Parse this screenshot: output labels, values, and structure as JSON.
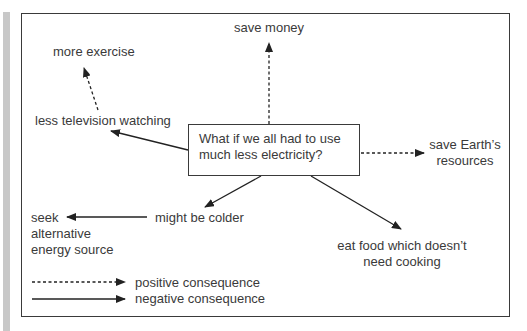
{
  "diagram": {
    "central_question": [
      "What if we all had to use",
      "much less electricity?"
    ],
    "nodes": {
      "save_money": "save money",
      "more_exercise": "more exercise",
      "less_tv": "less television watching",
      "save_resources": [
        "save Earth’s",
        "resources"
      ],
      "might_be_colder": "might be colder",
      "seek_alternative": [
        "seek",
        "alternative",
        "energy source"
      ],
      "eat_food": [
        "eat food which doesn’t",
        "need cooking"
      ]
    },
    "edges": [
      {
        "from": "central_question",
        "to": "save_money",
        "type": "positive"
      },
      {
        "from": "less_tv",
        "to": "more_exercise",
        "type": "positive"
      },
      {
        "from": "central_question",
        "to": "less_tv",
        "type": "negative"
      },
      {
        "from": "central_question",
        "to": "save_resources",
        "type": "positive"
      },
      {
        "from": "central_question",
        "to": "might_be_colder",
        "type": "negative"
      },
      {
        "from": "might_be_colder",
        "to": "seek_alternative",
        "type": "negative"
      },
      {
        "from": "central_question",
        "to": "eat_food",
        "type": "negative"
      }
    ],
    "legend": {
      "positive": "positive consequence",
      "negative": "negative consequence"
    }
  }
}
